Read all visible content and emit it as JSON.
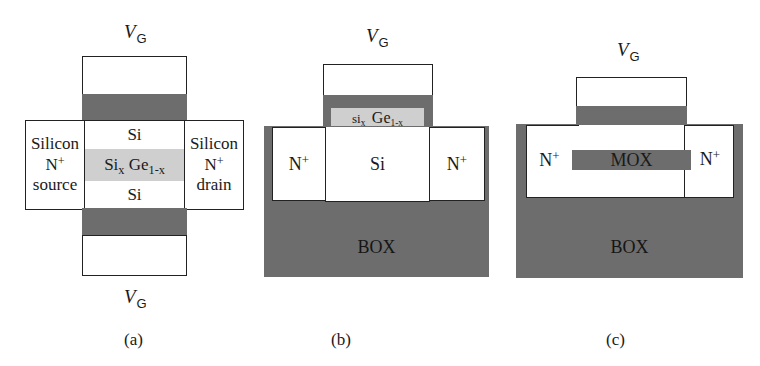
{
  "colors": {
    "oxide": "#6d6d6d",
    "sige": "#cfcfcf",
    "box": "#6d6d6d",
    "outline": "#222222",
    "fill": "#ffffff"
  },
  "panels": [
    {
      "caption": "(a)",
      "gate_label_top": {
        "v": "V",
        "sub": "G"
      },
      "gate_label_bottom": {
        "v": "V",
        "sub": "G"
      },
      "source": {
        "line1": "Silicon",
        "line2_base": "N",
        "line2_sup": "+",
        "line3": "source"
      },
      "drain": {
        "line1": "Silicon",
        "line2_base": "N",
        "line2_sup": "+",
        "line3": "drain"
      },
      "channel_top": "Si",
      "channel_mid": {
        "base1": "Si",
        "sub1": "x",
        "base2": "Ge",
        "sub2": "1-x"
      },
      "channel_bottom": "Si"
    },
    {
      "caption": "(b)",
      "gate_label_top": {
        "v": "V",
        "sub": "G"
      },
      "sige_strip": {
        "base1": "si",
        "sub1": "x",
        "base2": "Ge",
        "sub2": "1-x"
      },
      "n_left": {
        "base": "N",
        "sup": "+"
      },
      "channel": "Si",
      "n_right": {
        "base": "N",
        "sup": "+"
      },
      "box": "BOX"
    },
    {
      "caption": "(c)",
      "gate_label_top": {
        "v": "V",
        "sub": "G"
      },
      "n_left": {
        "base": "N",
        "sup": "+"
      },
      "mox": "MOX",
      "n_right": {
        "base": "N",
        "sup": "+"
      },
      "box": "BOX"
    }
  ]
}
